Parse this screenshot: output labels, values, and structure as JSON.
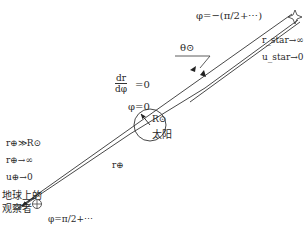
{
  "diagram": {
    "labels": {
      "phi_star": "φ=−(π/2+⋯)",
      "r_star": "r_star→∞",
      "u_star": "u_star→0",
      "theta_sun": "θ⊙",
      "dr_num": "dr",
      "dr_den": "dφ",
      "dr_eq": "=0",
      "phi_zero": "φ=0",
      "R_sun": "R⊙",
      "sun": "太阳",
      "r_earth_label": "r⊕",
      "cond1": "r⊕≫R⊙",
      "cond2": "r⊕→∞",
      "cond3": "u⊕→0",
      "observer_line1": "地球上的",
      "observer_line2": "观察者",
      "phi_earth": "φ=π/2+⋯"
    },
    "elements": [
      {
        "type": "star",
        "position": "top-right"
      },
      {
        "type": "circle",
        "name": "sun"
      },
      {
        "type": "line",
        "name": "true-light-ray"
      },
      {
        "type": "line",
        "name": "apparent-light-ray"
      },
      {
        "type": "arrow",
        "name": "radius-arrow"
      },
      {
        "type": "observer",
        "name": "earth-observer"
      }
    ]
  }
}
